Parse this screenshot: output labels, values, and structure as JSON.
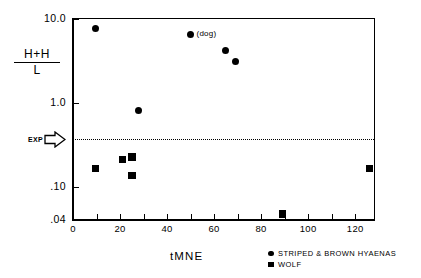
{
  "chart_data": {
    "type": "scatter",
    "title": "",
    "xlabel": "tMNE",
    "ylabel": "H+H/L",
    "ylabel_numerator": "H+H",
    "ylabel_denominator": "L",
    "xlim": [
      0,
      128
    ],
    "ylim": [
      0.04,
      10.0
    ],
    "yscale": "log",
    "xscale": "linear",
    "grid": false,
    "xticks": [
      0,
      10,
      20,
      30,
      40,
      50,
      60,
      70,
      80,
      90,
      100,
      110,
      120
    ],
    "xticklabels": [
      {
        "value": 0,
        "label": "0"
      },
      {
        "value": 20,
        "label": "20"
      },
      {
        "value": 40,
        "label": "40"
      },
      {
        "value": 60,
        "label": "60"
      },
      {
        "value": 80,
        "label": "80"
      },
      {
        "value": 100,
        "label": "100"
      },
      {
        "value": 120,
        "label": "120"
      }
    ],
    "yticks": [
      {
        "value": 10.0,
        "label": "10.0"
      },
      {
        "value": 1.0,
        "label": "1.0"
      },
      {
        "value": 0.1,
        "label": ".10"
      },
      {
        "value": 0.04,
        "label": ".04"
      }
    ],
    "reference_line": {
      "label": "EXP",
      "value": 0.37,
      "style": "dotted",
      "orientation": "horizontal"
    },
    "annotations": [
      {
        "text": "(dog)",
        "x": 50,
        "y": 6.6
      }
    ],
    "legend": {
      "position": "bottom-right",
      "entries": [
        {
          "label": "STRIPED & BROWN HYAENAS",
          "marker": "circle"
        },
        {
          "label": "WOLF",
          "marker": "square"
        }
      ]
    },
    "series": [
      {
        "name": "STRIPED & BROWN HYAENAS",
        "marker": "circle",
        "points": [
          {
            "x": 9.5,
            "y": 7.6
          },
          {
            "x": 28,
            "y": 0.82
          },
          {
            "x": 50,
            "y": 6.6
          },
          {
            "x": 65,
            "y": 4.2
          },
          {
            "x": 69,
            "y": 3.1
          }
        ]
      },
      {
        "name": "WOLF",
        "marker": "square",
        "points": [
          {
            "x": 9.5,
            "y": 0.165
          },
          {
            "x": 21,
            "y": 0.21
          },
          {
            "x": 25,
            "y": 0.225
          },
          {
            "x": 25,
            "y": 0.135
          },
          {
            "x": 89,
            "y": 0.047
          },
          {
            "x": 126,
            "y": 0.165
          }
        ]
      }
    ]
  }
}
